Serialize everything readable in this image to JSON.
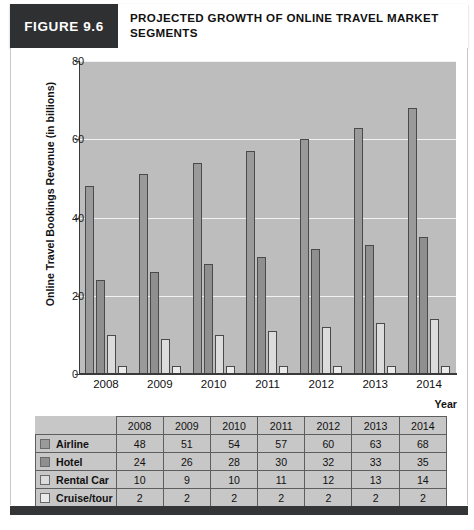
{
  "header": {
    "figure_number": "FIGURE 9.6",
    "title": "PROJECTED GROWTH OF ONLINE TRAVEL MARKET SEGMENTS"
  },
  "chart_data": {
    "type": "bar",
    "title": "PROJECTED GROWTH OF ONLINE TRAVEL MARKET SEGMENTS",
    "xlabel": "Year",
    "ylabel": "Online Travel Bookings Revenue (in billions)",
    "categories": [
      "2008",
      "2009",
      "2010",
      "2011",
      "2012",
      "2013",
      "2014"
    ],
    "ylim": [
      0,
      80
    ],
    "yticks": [
      0,
      20,
      40,
      60,
      80
    ],
    "grid": true,
    "legend_position": "table",
    "series": [
      {
        "name": "Airline",
        "color": "#9a9a9a",
        "values": [
          48,
          51,
          54,
          57,
          60,
          63,
          68
        ]
      },
      {
        "name": "Hotel",
        "color": "#8f8f8f",
        "values": [
          24,
          26,
          28,
          30,
          32,
          33,
          35
        ]
      },
      {
        "name": "Rental Car",
        "color": "#dcdcdc",
        "values": [
          10,
          9,
          10,
          11,
          12,
          13,
          14
        ]
      },
      {
        "name": "Cruise/tour",
        "color": "#eaeaea",
        "values": [
          2,
          2,
          2,
          2,
          2,
          2,
          2
        ]
      }
    ]
  },
  "table": {
    "corner_label": "",
    "columns": [
      "2008",
      "2009",
      "2010",
      "2011",
      "2012",
      "2013",
      "2014"
    ],
    "rows": [
      {
        "label": "Airline",
        "swatch": "#9a9a9a",
        "values": [
          "48",
          "51",
          "54",
          "57",
          "60",
          "63",
          "68"
        ]
      },
      {
        "label": "Hotel",
        "swatch": "#8f8f8f",
        "values": [
          "24",
          "26",
          "28",
          "30",
          "32",
          "33",
          "35"
        ]
      },
      {
        "label": "Rental Car",
        "swatch": "#dcdcdc",
        "values": [
          "10",
          "9",
          "10",
          "11",
          "12",
          "13",
          "14"
        ]
      },
      {
        "label": "Cruise/tour",
        "swatch": "#eaeaea",
        "values": [
          "2",
          "2",
          "2",
          "2",
          "2",
          "2",
          "2"
        ]
      }
    ]
  },
  "colors": {
    "header_dark": "#2f3031",
    "plot_background": "#bdbdbd",
    "gridline": "#f2f2f2",
    "axis": "#3a3a3a",
    "table_background": "#c7c7c7"
  }
}
